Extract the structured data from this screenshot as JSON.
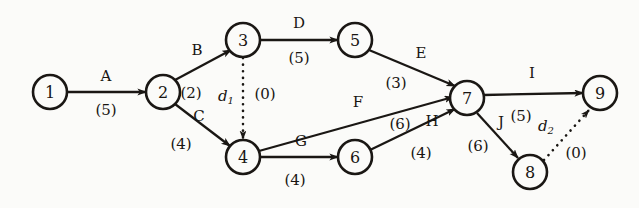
{
  "diagram": {
    "type": "activity-on-arrow-network",
    "title": "",
    "background_color": "#fbfbf9",
    "ink_color": "#1a1714",
    "nodes": [
      {
        "id": "n1",
        "label": "1",
        "x": 50,
        "y": 92,
        "r": 17
      },
      {
        "id": "n2",
        "label": "2",
        "x": 163,
        "y": 92,
        "r": 17
      },
      {
        "id": "n3",
        "label": "3",
        "x": 243,
        "y": 40,
        "r": 17
      },
      {
        "id": "n4",
        "label": "4",
        "x": 243,
        "y": 157,
        "r": 17
      },
      {
        "id": "n5",
        "label": "5",
        "x": 355,
        "y": 40,
        "r": 17
      },
      {
        "id": "n6",
        "label": "6",
        "x": 355,
        "y": 157,
        "r": 17
      },
      {
        "id": "n7",
        "label": "7",
        "x": 467,
        "y": 98,
        "r": 17
      },
      {
        "id": "n8",
        "label": "8",
        "x": 530,
        "y": 172,
        "r": 17
      },
      {
        "id": "n9",
        "label": "9",
        "x": 600,
        "y": 93,
        "r": 17
      }
    ],
    "edges": [
      {
        "id": "eA",
        "activity": "A",
        "duration": "(5)",
        "from": "1",
        "to": "2",
        "style": "solid",
        "x1": 67,
        "y1": 92,
        "x2": 146,
        "y2": 92,
        "act_x": 106,
        "act_y": 76,
        "dur_x": 106,
        "dur_y": 110
      },
      {
        "id": "eB",
        "activity": "B",
        "duration": "(2)",
        "from": "2",
        "to": "3",
        "style": "solid",
        "x1": 175,
        "y1": 80,
        "x2": 231,
        "y2": 50,
        "act_x": 197,
        "act_y": 50,
        "dur_x": 191,
        "dur_y": 93
      },
      {
        "id": "eC",
        "activity": "C",
        "duration": "(4)",
        "from": "2",
        "to": "4",
        "style": "solid",
        "x1": 175,
        "y1": 104,
        "x2": 230,
        "y2": 146,
        "act_x": 199,
        "act_y": 116,
        "dur_x": 181,
        "dur_y": 144
      },
      {
        "id": "eD",
        "activity": "D",
        "duration": "(5)",
        "from": "3",
        "to": "5",
        "style": "solid",
        "x1": 260,
        "y1": 40,
        "x2": 338,
        "y2": 40,
        "act_x": 299,
        "act_y": 23,
        "dur_x": 299,
        "dur_y": 58
      },
      {
        "id": "eE",
        "activity": "E",
        "duration": "(3)",
        "from": "5",
        "to": "7",
        "style": "solid",
        "x1": 369,
        "y1": 50,
        "x2": 455,
        "y2": 86,
        "act_x": 421,
        "act_y": 53,
        "dur_x": 396,
        "dur_y": 83
      },
      {
        "id": "eF",
        "activity": "F",
        "duration": "(6)",
        "from": "4",
        "to": "7",
        "style": "solid",
        "x1": 259,
        "y1": 151,
        "x2": 453,
        "y2": 97,
        "act_x": 358,
        "act_y": 102,
        "dur_x": 400,
        "dur_y": 124
      },
      {
        "id": "eG",
        "activity": "G",
        "duration": "(4)",
        "from": "4",
        "to": "6",
        "style": "solid",
        "x1": 260,
        "y1": 157,
        "x2": 338,
        "y2": 157,
        "act_x": 301,
        "act_y": 141,
        "dur_x": 295,
        "dur_y": 180
      },
      {
        "id": "eH",
        "activity": "H",
        "duration": "(4)",
        "from": "6",
        "to": "7",
        "style": "solid",
        "x1": 370,
        "y1": 150,
        "x2": 455,
        "y2": 109,
        "act_x": 432,
        "act_y": 121,
        "dur_x": 421,
        "dur_y": 153
      },
      {
        "id": "eI",
        "activity": "I",
        "duration": "(5)",
        "from": "7",
        "to": "9",
        "style": "solid",
        "x1": 484,
        "y1": 95,
        "x2": 583,
        "y2": 93,
        "act_x": 532,
        "act_y": 73,
        "dur_x": 521,
        "dur_y": 116
      },
      {
        "id": "eJ",
        "activity": "J",
        "duration": "(6)",
        "from": "7",
        "to": "8",
        "style": "solid",
        "x1": 477,
        "y1": 113,
        "x2": 518,
        "y2": 158,
        "act_x": 501,
        "act_y": 122,
        "dur_x": 478,
        "dur_y": 146
      }
    ],
    "dummy_edges": [
      {
        "id": "d1",
        "label": "d",
        "subscript": "1",
        "duration": "(0)",
        "from": "3",
        "to": "4",
        "style": "dotted",
        "x1": 243,
        "y1": 58,
        "x2": 243,
        "y2": 139,
        "lab_x": 226,
        "lab_y": 96,
        "dur_x": 265,
        "dur_y": 94
      },
      {
        "id": "d2",
        "label": "d",
        "subscript": "2",
        "duration": "(0)",
        "from": "8",
        "to": "9",
        "style": "dotted",
        "x1": 544,
        "y1": 160,
        "x2": 589,
        "y2": 110,
        "lab_x": 546,
        "lab_y": 126,
        "dur_x": 576,
        "dur_y": 153
      }
    ]
  }
}
